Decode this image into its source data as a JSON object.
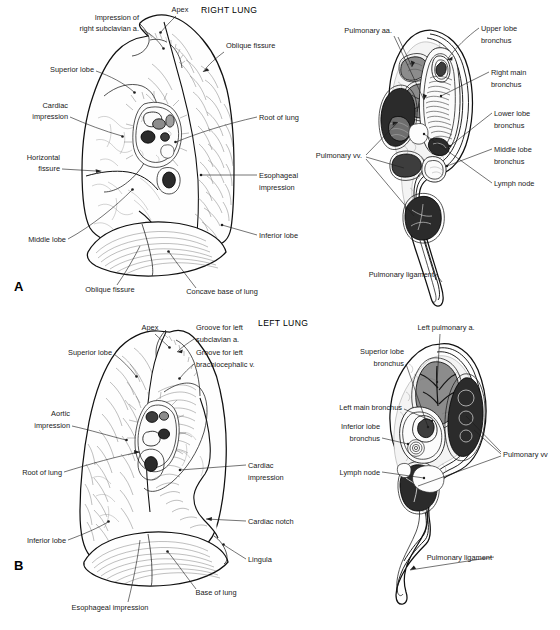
{
  "figure": {
    "kind": "anatomical-illustration",
    "panels": [
      {
        "key": "A",
        "title": "RIGHT LUNG",
        "view": "medial-surface",
        "labels": [
          "Impression of",
          "right subclavian a.",
          "Apex",
          "Oblique fissure",
          "Superior lobe",
          "Cardiac",
          "impression",
          "Root of lung",
          "Horizontal",
          "fissure",
          "Esophageal",
          "impression",
          "Middle lobe",
          "Inferior lobe",
          "Oblique fissure",
          "Concave base of lung"
        ]
      },
      {
        "key": "A-hilum",
        "title": "RIGHT LUNG",
        "view": "hilum-cross-section",
        "labels": [
          "Pulmonary aa.",
          "Upper lobe",
          "bronchus",
          "Right main",
          "bronchus",
          "Lower lobe",
          "bronchus",
          "Middle lobe",
          "bronchus",
          "Pulmonary vv.",
          "Lymph node",
          "Pulmonary ligament"
        ]
      },
      {
        "key": "B",
        "title": "LEFT LUNG",
        "view": "medial-surface",
        "labels": [
          "Apex",
          "Groove for left",
          "subclavian a.",
          "Groove for left",
          "brachiocephalic v.",
          "Superior lobe",
          "Aortic",
          "impression",
          "Root of lung",
          "Cardiac",
          "impression",
          "Cardiac notch",
          "Inferior lobe",
          "Lingula",
          "Esophageal impression",
          "Base of lung"
        ]
      },
      {
        "key": "B-hilum",
        "title": "LEFT LUNG",
        "view": "hilum-cross-section",
        "labels": [
          "Left pulmonary a.",
          "Superior lobe",
          "bronchus",
          "Left main bronchus",
          "Inferior lobe",
          "bronchus",
          "Lymph node",
          "Pulmonary vv",
          "Pulmonary ligament"
        ]
      }
    ]
  },
  "panel_a": {
    "key": "A",
    "title": "RIGHT LUNG",
    "l_impression_1": "Impression of",
    "l_impression_2": "right subclavian a.",
    "l_apex": "Apex",
    "l_oblique_top": "Oblique fissure",
    "l_superior_lobe": "Superior lobe",
    "l_cardiac_1": "Cardiac",
    "l_cardiac_2": "impression",
    "l_root": "Root of lung",
    "l_horizontal_1": "Horizontal",
    "l_horizontal_2": "fissure",
    "l_esophageal_1": "Esophageal",
    "l_esophageal_2": "impression",
    "l_middle_lobe": "Middle lobe",
    "l_inferior_lobe": "Inferior lobe",
    "l_oblique_bottom": "Oblique fissure",
    "l_concave_base": "Concave base of lung"
  },
  "panel_a_hilum": {
    "l_pulm_aa": "Pulmonary aa.",
    "l_upper_1": "Upper lobe",
    "l_upper_2": "bronchus",
    "l_rmain_1": "Right main",
    "l_rmain_2": "bronchus",
    "l_lower_1": "Lower lobe",
    "l_lower_2": "bronchus",
    "l_middle_1": "Middle lobe",
    "l_middle_2": "bronchus",
    "l_pulm_vv": "Pulmonary vv.",
    "l_lymph": "Lymph node",
    "l_ligament": "Pulmonary ligament"
  },
  "panel_b": {
    "key": "B",
    "title": "LEFT LUNG",
    "l_apex": "Apex",
    "l_groove_sub_1": "Groove for left",
    "l_groove_sub_2": "subclavian a.",
    "l_groove_bra_1": "Groove for left",
    "l_groove_bra_2": "brachiocephalic v.",
    "l_superior_lobe": "Superior lobe",
    "l_aortic_1": "Aortic",
    "l_aortic_2": "impression",
    "l_root": "Root of lung",
    "l_cardiac_1": "Cardiac",
    "l_cardiac_2": "impression",
    "l_cardiac_notch": "Cardiac notch",
    "l_inferior_lobe": "Inferior lobe",
    "l_lingula": "Lingula",
    "l_esophageal": "Esophageal impression",
    "l_base": "Base of lung"
  },
  "panel_b_hilum": {
    "l_left_pulm_a": "Left pulmonary a.",
    "l_sup_1": "Superior lobe",
    "l_sup_2": "bronchus",
    "l_lmain": "Left main bronchus",
    "l_inf_1": "Inferior lobe",
    "l_inf_2": "bronchus",
    "l_lymph": "Lymph node",
    "l_pulm_vv": "Pulmonary vv",
    "l_ligament": "Pulmonary ligament"
  },
  "colors": {
    "background": "#ffffff",
    "ink": "#1a1a1a",
    "outline": "#101010",
    "vein_fill": "#2b2b2b",
    "artery_fill": "#8c8c8c",
    "bronchus_fill": "#fbfbfb",
    "hatch": "#777777"
  }
}
